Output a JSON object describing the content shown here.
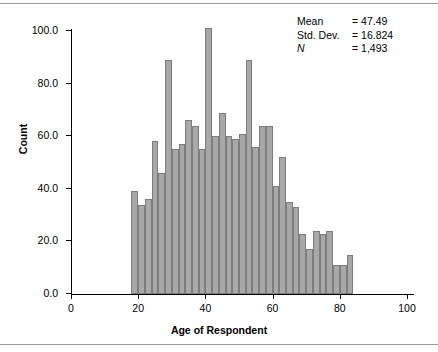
{
  "chart_data": {
    "type": "bar",
    "title": "",
    "xlabel": "Age of Respondent",
    "ylabel": "Count",
    "xlim": [
      0,
      100
    ],
    "ylim": [
      0,
      100
    ],
    "grid": false,
    "legend": null,
    "bin_width": 2,
    "xticks": [
      "0",
      "20",
      "40",
      "60",
      "80",
      "100"
    ],
    "xtick_values": [
      0,
      20,
      40,
      60,
      80,
      100
    ],
    "yticks": [
      "0.0",
      "20.0",
      "40.0",
      "60.0",
      "80.0",
      "100.0"
    ],
    "ytick_values": [
      0,
      20,
      40,
      60,
      80,
      100
    ],
    "x": [
      19,
      21,
      23,
      25,
      27,
      29,
      31,
      33,
      35,
      37,
      39,
      41,
      43,
      45,
      47,
      49,
      51,
      53,
      55,
      57,
      59,
      61,
      63,
      65,
      67,
      69,
      71,
      73,
      75,
      77,
      79,
      81,
      83,
      85,
      87,
      89,
      91
    ],
    "values": [
      39,
      34,
      36,
      58,
      46,
      89,
      55,
      57,
      66,
      64,
      55,
      101,
      60,
      69,
      60,
      59,
      61,
      89,
      56,
      64,
      64,
      41,
      52,
      35,
      33,
      23,
      17,
      24,
      23,
      24,
      11,
      11,
      15,
      0,
      0,
      0,
      0
    ],
    "bars": [
      {
        "bin_start": 18,
        "bin_end": 20,
        "count": 39
      },
      {
        "bin_start": 20,
        "bin_end": 22,
        "count": 34
      },
      {
        "bin_start": 22,
        "bin_end": 24,
        "count": 36
      },
      {
        "bin_start": 24,
        "bin_end": 26,
        "count": 58
      },
      {
        "bin_start": 26,
        "bin_end": 28,
        "count": 46
      },
      {
        "bin_start": 28,
        "bin_end": 30,
        "count": 89
      },
      {
        "bin_start": 30,
        "bin_end": 32,
        "count": 55
      },
      {
        "bin_start": 32,
        "bin_end": 34,
        "count": 57
      },
      {
        "bin_start": 34,
        "bin_end": 36,
        "count": 66
      },
      {
        "bin_start": 36,
        "bin_end": 38,
        "count": 64
      },
      {
        "bin_start": 38,
        "bin_end": 40,
        "count": 55
      },
      {
        "bin_start": 40,
        "bin_end": 42,
        "count": 101
      },
      {
        "bin_start": 42,
        "bin_end": 44,
        "count": 60
      },
      {
        "bin_start": 44,
        "bin_end": 46,
        "count": 69
      },
      {
        "bin_start": 46,
        "bin_end": 48,
        "count": 60
      },
      {
        "bin_start": 48,
        "bin_end": 50,
        "count": 59
      },
      {
        "bin_start": 50,
        "bin_end": 52,
        "count": 61
      },
      {
        "bin_start": 52,
        "bin_end": 54,
        "count": 89
      },
      {
        "bin_start": 54,
        "bin_end": 56,
        "count": 56
      },
      {
        "bin_start": 56,
        "bin_end": 58,
        "count": 64
      },
      {
        "bin_start": 58,
        "bin_end": 60,
        "count": 64
      },
      {
        "bin_start": 60,
        "bin_end": 62,
        "count": 41
      },
      {
        "bin_start": 62,
        "bin_end": 64,
        "count": 52
      },
      {
        "bin_start": 64,
        "bin_end": 66,
        "count": 35
      },
      {
        "bin_start": 66,
        "bin_end": 68,
        "count": 33
      },
      {
        "bin_start": 68,
        "bin_end": 70,
        "count": 23
      },
      {
        "bin_start": 70,
        "bin_end": 72,
        "count": 17
      },
      {
        "bin_start": 72,
        "bin_end": 74,
        "count": 24
      },
      {
        "bin_start": 74,
        "bin_end": 76,
        "count": 23
      },
      {
        "bin_start": 76,
        "bin_end": 78,
        "count": 24
      },
      {
        "bin_start": 78,
        "bin_end": 80,
        "count": 11
      },
      {
        "bin_start": 80,
        "bin_end": 82,
        "count": 11
      },
      {
        "bin_start": 82,
        "bin_end": 84,
        "count": 15
      }
    ]
  },
  "stats": {
    "mean_label": "Mean",
    "mean_value": "= 47.49",
    "sd_label": "Std. Dev.",
    "sd_value": "= 16.824",
    "n_label": "N",
    "n_value": "= 1,493"
  },
  "colors": {
    "bar_fill": "#a8a8a8",
    "bar_edge": "#7d7d7d",
    "axis": "#000000",
    "rule": "#9a9a9a",
    "background": "#ffffff"
  }
}
